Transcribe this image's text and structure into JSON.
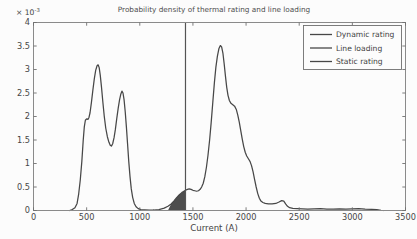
{
  "colors": {
    "curve": "#474747",
    "static_line": "#545454",
    "shade": "#4d4d4d",
    "axis": "#8a8a8a",
    "tick": "#6f6f6f",
    "text": "#464646",
    "background": "#fcfcfc"
  },
  "chart_data": {
    "type": "line",
    "title": "Probability density of thermal rating and line loading",
    "xlabel": "Current (A)",
    "ylabel": "",
    "y_exponent_base": "× 10",
    "y_exponent_power": "-3",
    "xlim": [
      0,
      3500
    ],
    "ylim_display": [
      0,
      4
    ],
    "y_unit_multiplier": "1e-3",
    "grid": false,
    "x_tick_values": [
      0,
      500,
      1000,
      1500,
      2000,
      2500,
      3000,
      3500
    ],
    "x_tick_labels": [
      "0",
      "500",
      "1000",
      "1500",
      "2000",
      "2500",
      "3000",
      "3500"
    ],
    "y_tick_values": [
      0,
      0.5,
      1,
      1.5,
      2,
      2.5,
      3,
      3.5,
      4
    ],
    "y_tick_labels": [
      "0",
      "0.5",
      "1",
      "1.5",
      "2",
      "2.5",
      "3",
      "3.5",
      "4"
    ],
    "legend": {
      "position": "top-right",
      "entries": [
        "Dynamic rating",
        "Line loading",
        "Static rating"
      ]
    },
    "series": [
      {
        "name": "Line loading",
        "type": "line",
        "points": [
          [
            340,
            0
          ],
          [
            365,
            0.02
          ],
          [
            390,
            0.06
          ],
          [
            410,
            0.15
          ],
          [
            425,
            0.35
          ],
          [
            440,
            0.65
          ],
          [
            455,
            1.05
          ],
          [
            468,
            1.5
          ],
          [
            478,
            1.78
          ],
          [
            488,
            1.92
          ],
          [
            500,
            1.95
          ],
          [
            512,
            1.94
          ],
          [
            522,
            1.98
          ],
          [
            532,
            2.08
          ],
          [
            545,
            2.3
          ],
          [
            558,
            2.55
          ],
          [
            572,
            2.8
          ],
          [
            585,
            2.98
          ],
          [
            598,
            3.08
          ],
          [
            608,
            3.1
          ],
          [
            618,
            3.04
          ],
          [
            628,
            2.88
          ],
          [
            640,
            2.62
          ],
          [
            652,
            2.32
          ],
          [
            665,
            2.02
          ],
          [
            680,
            1.75
          ],
          [
            695,
            1.57
          ],
          [
            710,
            1.45
          ],
          [
            722,
            1.39
          ],
          [
            733,
            1.37
          ],
          [
            745,
            1.42
          ],
          [
            758,
            1.55
          ],
          [
            770,
            1.72
          ],
          [
            783,
            1.95
          ],
          [
            797,
            2.18
          ],
          [
            810,
            2.36
          ],
          [
            822,
            2.48
          ],
          [
            832,
            2.54
          ],
          [
            842,
            2.5
          ],
          [
            852,
            2.36
          ],
          [
            863,
            2.1
          ],
          [
            874,
            1.78
          ],
          [
            885,
            1.42
          ],
          [
            896,
            1.05
          ],
          [
            908,
            0.72
          ],
          [
            920,
            0.46
          ],
          [
            933,
            0.28
          ],
          [
            948,
            0.15
          ],
          [
            965,
            0.08
          ],
          [
            985,
            0.04
          ],
          [
            1010,
            0.02
          ],
          [
            1045,
            0.015
          ],
          [
            1090,
            0.01
          ],
          [
            1130,
            0.008
          ]
        ]
      },
      {
        "name": "Dynamic rating",
        "type": "line",
        "points": [
          [
            1130,
            0.01
          ],
          [
            1180,
            0.02
          ],
          [
            1230,
            0.05
          ],
          [
            1265,
            0.09
          ],
          [
            1295,
            0.14
          ],
          [
            1320,
            0.2
          ],
          [
            1345,
            0.27
          ],
          [
            1370,
            0.33
          ],
          [
            1395,
            0.38
          ],
          [
            1415,
            0.41
          ],
          [
            1430,
            0.43
          ],
          [
            1448,
            0.45
          ],
          [
            1465,
            0.46
          ],
          [
            1482,
            0.45
          ],
          [
            1500,
            0.43
          ],
          [
            1518,
            0.42
          ],
          [
            1535,
            0.41
          ],
          [
            1552,
            0.42
          ],
          [
            1568,
            0.45
          ],
          [
            1582,
            0.5
          ],
          [
            1597,
            0.58
          ],
          [
            1612,
            0.72
          ],
          [
            1627,
            0.92
          ],
          [
            1642,
            1.18
          ],
          [
            1657,
            1.5
          ],
          [
            1672,
            1.88
          ],
          [
            1687,
            2.3
          ],
          [
            1702,
            2.72
          ],
          [
            1716,
            3.05
          ],
          [
            1730,
            3.28
          ],
          [
            1744,
            3.44
          ],
          [
            1758,
            3.51
          ],
          [
            1770,
            3.48
          ],
          [
            1782,
            3.35
          ],
          [
            1794,
            3.12
          ],
          [
            1806,
            2.86
          ],
          [
            1818,
            2.62
          ],
          [
            1830,
            2.45
          ],
          [
            1843,
            2.34
          ],
          [
            1858,
            2.28
          ],
          [
            1875,
            2.25
          ],
          [
            1892,
            2.22
          ],
          [
            1908,
            2.15
          ],
          [
            1922,
            2.03
          ],
          [
            1936,
            1.88
          ],
          [
            1950,
            1.7
          ],
          [
            1964,
            1.52
          ],
          [
            1978,
            1.36
          ],
          [
            1992,
            1.24
          ],
          [
            2006,
            1.16
          ],
          [
            2022,
            1.1
          ],
          [
            2038,
            1.04
          ],
          [
            2052,
            0.95
          ],
          [
            2066,
            0.82
          ],
          [
            2080,
            0.66
          ],
          [
            2095,
            0.5
          ],
          [
            2110,
            0.36
          ],
          [
            2125,
            0.26
          ],
          [
            2140,
            0.2
          ],
          [
            2158,
            0.17
          ],
          [
            2180,
            0.15
          ],
          [
            2210,
            0.14
          ],
          [
            2245,
            0.14
          ],
          [
            2280,
            0.15
          ],
          [
            2310,
            0.18
          ],
          [
            2335,
            0.21
          ],
          [
            2355,
            0.2
          ],
          [
            2372,
            0.14
          ],
          [
            2390,
            0.09
          ],
          [
            2410,
            0.06
          ],
          [
            2440,
            0.045
          ],
          [
            2480,
            0.04
          ],
          [
            2530,
            0.035
          ],
          [
            2580,
            0.03
          ],
          [
            2640,
            0.035
          ],
          [
            2700,
            0.04
          ],
          [
            2760,
            0.03
          ],
          [
            2820,
            0.03
          ],
          [
            2880,
            0.035
          ],
          [
            2940,
            0.03
          ],
          [
            3000,
            0.035
          ],
          [
            3060,
            0.04
          ],
          [
            3120,
            0.03
          ],
          [
            3180,
            0.025
          ],
          [
            3230,
            0.02
          ],
          [
            3270,
            0.005
          ],
          [
            3290,
            0
          ]
        ]
      },
      {
        "name": "Static rating",
        "type": "vline",
        "x": 1430
      }
    ],
    "overlap_region": {
      "description": "shaded overlap between line loading tail and dynamic rating lower tail, left of static rating line",
      "points": [
        [
          1265,
          0
        ],
        [
          1295,
          0.14
        ],
        [
          1320,
          0.2
        ],
        [
          1345,
          0.27
        ],
        [
          1370,
          0.33
        ],
        [
          1395,
          0.38
        ],
        [
          1415,
          0.41
        ],
        [
          1430,
          0.43
        ],
        [
          1430,
          0
        ]
      ]
    }
  }
}
